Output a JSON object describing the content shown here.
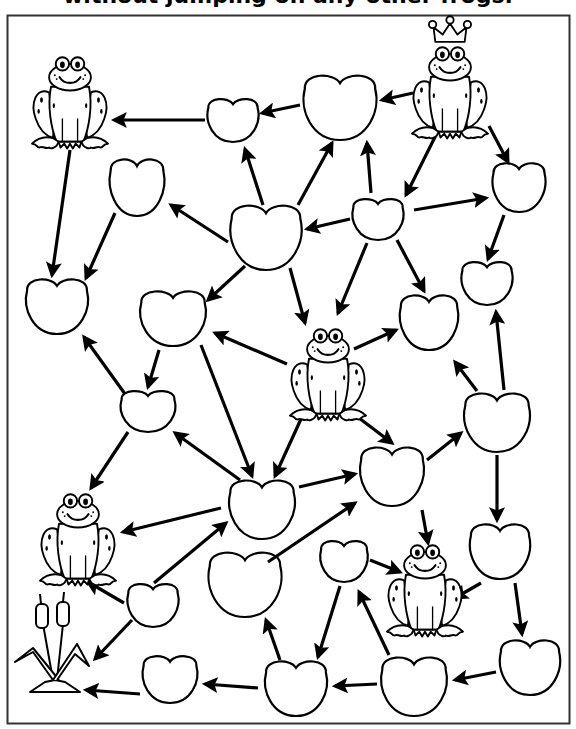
{
  "puzzle": {
    "title": "without jumping on any other frogs.",
    "instructions_truncated": true,
    "colors": {
      "ink": "#000000",
      "paper": "#ffffff",
      "border": "#333333"
    }
  },
  "frogs": [
    {
      "id": "frog-top-left",
      "x": 70,
      "y": 100,
      "crowned": false
    },
    {
      "id": "frog-king",
      "x": 450,
      "y": 90,
      "crowned": true
    },
    {
      "id": "frog-center",
      "x": 328,
      "y": 372,
      "crowned": false
    },
    {
      "id": "frog-bottom-left",
      "x": 78,
      "y": 537,
      "crowned": false
    },
    {
      "id": "frog-bottom-right",
      "x": 425,
      "y": 588,
      "crowned": false
    }
  ],
  "goal": {
    "id": "cattails",
    "x": 55,
    "y": 650,
    "label": "cattails"
  },
  "pads": [
    {
      "id": "P1",
      "cx": 233,
      "cy": 120,
      "rx": 28,
      "ry": 22
    },
    {
      "id": "P2",
      "cx": 340,
      "cy": 107,
      "rx": 40,
      "ry": 33
    },
    {
      "id": "P3",
      "cx": 137,
      "cy": 187,
      "rx": 30,
      "ry": 29
    },
    {
      "id": "P4",
      "cx": 266,
      "cy": 237,
      "rx": 39,
      "ry": 33
    },
    {
      "id": "P5",
      "cx": 378,
      "cy": 219,
      "rx": 28,
      "ry": 21
    },
    {
      "id": "P6",
      "cx": 519,
      "cy": 187,
      "rx": 29,
      "ry": 25
    },
    {
      "id": "P7",
      "cx": 57,
      "cy": 306,
      "rx": 34,
      "ry": 28
    },
    {
      "id": "P8",
      "cx": 173,
      "cy": 318,
      "rx": 36,
      "ry": 28
    },
    {
      "id": "P9",
      "cx": 429,
      "cy": 322,
      "rx": 32,
      "ry": 28
    },
    {
      "id": "P10",
      "cx": 487,
      "cy": 283,
      "rx": 28,
      "ry": 22
    },
    {
      "id": "P11",
      "cx": 148,
      "cy": 411,
      "rx": 30,
      "ry": 21
    },
    {
      "id": "P12",
      "cx": 497,
      "cy": 422,
      "rx": 36,
      "ry": 30
    },
    {
      "id": "P13",
      "cx": 262,
      "cy": 509,
      "rx": 36,
      "ry": 30
    },
    {
      "id": "P14",
      "cx": 392,
      "cy": 476,
      "rx": 35,
      "ry": 30
    },
    {
      "id": "P15",
      "cx": 500,
      "cy": 551,
      "rx": 33,
      "ry": 28
    },
    {
      "id": "P16",
      "cx": 344,
      "cy": 561,
      "rx": 26,
      "ry": 21
    },
    {
      "id": "P17",
      "cx": 245,
      "cy": 584,
      "rx": 40,
      "ry": 33
    },
    {
      "id": "P18",
      "cx": 153,
      "cy": 605,
      "rx": 28,
      "ry": 22
    },
    {
      "id": "P19",
      "cx": 530,
      "cy": 667,
      "rx": 33,
      "ry": 28
    },
    {
      "id": "P20",
      "cx": 296,
      "cy": 688,
      "rx": 34,
      "ry": 28
    },
    {
      "id": "P21",
      "cx": 414,
      "cy": 686,
      "rx": 36,
      "ry": 30
    },
    {
      "id": "P22",
      "cx": 170,
      "cy": 679,
      "rx": 30,
      "ry": 24
    }
  ],
  "arrows": [
    {
      "from": "frog-king",
      "to": "P2",
      "x1": 413,
      "y1": 93,
      "x2": 382,
      "y2": 100
    },
    {
      "from": "P2",
      "to": "P1",
      "x1": 300,
      "y1": 105,
      "x2": 262,
      "y2": 113
    },
    {
      "from": "P1",
      "to": "frog-top-left",
      "x1": 205,
      "y1": 120,
      "x2": 114,
      "y2": 120
    },
    {
      "from": "frog-top-left",
      "to": "P7",
      "x1": 70,
      "y1": 150,
      "x2": 52,
      "y2": 275
    },
    {
      "from": "P3",
      "to": "P7",
      "x1": 115,
      "y1": 213,
      "x2": 86,
      "y2": 278
    },
    {
      "from": "P4",
      "to": "P3",
      "x1": 228,
      "y1": 242,
      "x2": 171,
      "y2": 205
    },
    {
      "from": "P4",
      "to": "P1",
      "x1": 263,
      "y1": 205,
      "x2": 245,
      "y2": 149
    },
    {
      "from": "P4",
      "to": "P2",
      "x1": 298,
      "y1": 205,
      "x2": 332,
      "y2": 143
    },
    {
      "from": "P5",
      "to": "P2",
      "x1": 371,
      "y1": 193,
      "x2": 367,
      "y2": 143
    },
    {
      "from": "frog-king",
      "to": "P5",
      "x1": 437,
      "y1": 133,
      "x2": 406,
      "y2": 195
    },
    {
      "from": "frog-king",
      "to": "P6",
      "x1": 489,
      "y1": 126,
      "x2": 508,
      "y2": 162
    },
    {
      "from": "P5",
      "to": "P4",
      "x1": 350,
      "y1": 219,
      "x2": 307,
      "y2": 229
    },
    {
      "from": "P5",
      "to": "P6",
      "x1": 414,
      "y1": 210,
      "x2": 486,
      "y2": 198
    },
    {
      "from": "P6",
      "to": "P10",
      "x1": 504,
      "y1": 215,
      "x2": 488,
      "y2": 259
    },
    {
      "from": "P4",
      "to": "P8",
      "x1": 245,
      "y1": 266,
      "x2": 208,
      "y2": 300
    },
    {
      "from": "P4",
      "to": "frog-center",
      "x1": 290,
      "y1": 268,
      "x2": 305,
      "y2": 323
    },
    {
      "from": "P5",
      "to": "frog-center",
      "x1": 367,
      "y1": 243,
      "x2": 338,
      "y2": 313
    },
    {
      "from": "P5",
      "to": "P9",
      "x1": 397,
      "y1": 240,
      "x2": 424,
      "y2": 291
    },
    {
      "from": "frog-center",
      "to": "P9",
      "x1": 354,
      "y1": 349,
      "x2": 396,
      "y2": 330
    },
    {
      "from": "frog-center",
      "to": "P8",
      "x1": 287,
      "y1": 364,
      "x2": 215,
      "y2": 333
    },
    {
      "from": "P12",
      "to": "P9",
      "x1": 477,
      "y1": 391,
      "x2": 455,
      "y2": 362
    },
    {
      "from": "P12",
      "to": "P10",
      "x1": 504,
      "y1": 390,
      "x2": 496,
      "y2": 312
    },
    {
      "from": "P8",
      "to": "P11",
      "x1": 159,
      "y1": 350,
      "x2": 148,
      "y2": 387
    },
    {
      "from": "P11",
      "to": "P7",
      "x1": 125,
      "y1": 394,
      "x2": 84,
      "y2": 337
    },
    {
      "from": "P8",
      "to": "P13",
      "x1": 201,
      "y1": 345,
      "x2": 252,
      "y2": 476
    },
    {
      "from": "frog-center",
      "to": "P13",
      "x1": 301,
      "y1": 419,
      "x2": 275,
      "y2": 476
    },
    {
      "from": "frog-center",
      "to": "P14",
      "x1": 359,
      "y1": 418,
      "x2": 392,
      "y2": 443
    },
    {
      "from": "P13",
      "to": "P11",
      "x1": 240,
      "y1": 480,
      "x2": 175,
      "y2": 433
    },
    {
      "from": "P11",
      "to": "frog-bottom-left",
      "x1": 128,
      "y1": 432,
      "x2": 91,
      "y2": 488
    },
    {
      "from": "P13",
      "to": "frog-bottom-left",
      "x1": 221,
      "y1": 508,
      "x2": 123,
      "y2": 532
    },
    {
      "from": "P13",
      "to": "P14",
      "x1": 299,
      "y1": 487,
      "x2": 355,
      "y2": 474
    },
    {
      "from": "P14",
      "to": "P12",
      "x1": 427,
      "y1": 460,
      "x2": 461,
      "y2": 433
    },
    {
      "from": "P12",
      "to": "P15",
      "x1": 497,
      "y1": 455,
      "x2": 497,
      "y2": 520
    },
    {
      "from": "P14",
      "to": "frog-bottom-right",
      "x1": 422,
      "y1": 510,
      "x2": 428,
      "y2": 543
    },
    {
      "from": "P16",
      "to": "frog-bottom-right",
      "x1": 370,
      "y1": 560,
      "x2": 400,
      "y2": 572
    },
    {
      "from": "P15",
      "to": "frog-bottom-right",
      "x1": 481,
      "y1": 583,
      "x2": 455,
      "y2": 598
    },
    {
      "from": "P15",
      "to": "P19",
      "x1": 515,
      "y1": 583,
      "x2": 522,
      "y2": 634
    },
    {
      "from": "P17",
      "to": "P14",
      "x1": 268,
      "y1": 562,
      "x2": 355,
      "y2": 503
    },
    {
      "from": "P18",
      "to": "P13",
      "x1": 154,
      "y1": 583,
      "x2": 226,
      "y2": 523
    },
    {
      "from": "P18",
      "to": "frog-bottom-left",
      "x1": 124,
      "y1": 603,
      "x2": 88,
      "y2": 582
    },
    {
      "from": "P18",
      "to": "cattails",
      "x1": 132,
      "y1": 620,
      "x2": 95,
      "y2": 659
    },
    {
      "from": "P16",
      "to": "P20",
      "x1": 340,
      "y1": 586,
      "x2": 318,
      "y2": 657
    },
    {
      "from": "P21",
      "to": "P16",
      "x1": 389,
      "y1": 655,
      "x2": 359,
      "y2": 592
    },
    {
      "from": "P20",
      "to": "P17",
      "x1": 280,
      "y1": 660,
      "x2": 266,
      "y2": 620
    },
    {
      "from": "P19",
      "to": "P21",
      "x1": 496,
      "y1": 672,
      "x2": 455,
      "y2": 680
    },
    {
      "from": "P21",
      "to": "P20",
      "x1": 377,
      "y1": 684,
      "x2": 335,
      "y2": 686
    },
    {
      "from": "P20",
      "to": "P22",
      "x1": 258,
      "y1": 688,
      "x2": 205,
      "y2": 684
    },
    {
      "from": "P22",
      "to": "cattails",
      "x1": 140,
      "y1": 694,
      "x2": 86,
      "y2": 690
    }
  ]
}
